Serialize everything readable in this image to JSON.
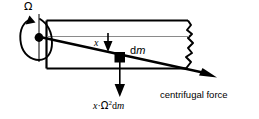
{
  "diagram": {
    "background_color": "#ffffff",
    "line_color": "#000000",
    "centerline_color": "#7f7f7f",
    "labels": {
      "omega": "Ω",
      "x": "x",
      "dm_prefix": "d",
      "dm_italic": "m",
      "force_formula_x": "x",
      "force_formula_dot": "·",
      "force_formula_omega": "Ω",
      "force_formula_exponent": "2",
      "force_formula_d": "d",
      "force_formula_m": "m",
      "centrifugal_force": "centrifugal force"
    },
    "elements": {
      "rotation_arrow": "curved-rotation-arrow",
      "pivot": "pivot-dot",
      "beam": "beam-rectangle",
      "beam_break": "jagged-break-edge",
      "centerline": "beam-centerline",
      "mass_element": "mass-element-square",
      "force_vector": "diagonal-force-arrow",
      "x_dimension_arrow": "x-dimension-down-arrow",
      "weight_arrow": "vertical-force-down-arrow"
    }
  }
}
